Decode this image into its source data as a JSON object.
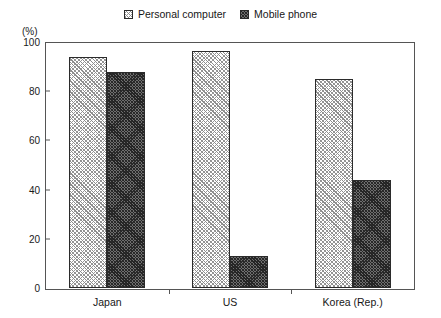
{
  "chart_data": {
    "type": "bar",
    "title": "",
    "subtitle": "",
    "xlabel": "",
    "ylabel": "(%)",
    "ylim": [
      0,
      100
    ],
    "yticks": [
      0,
      20,
      40,
      60,
      80,
      100
    ],
    "ytick_labels": [
      "0",
      "20",
      "40",
      "60",
      "80",
      "100"
    ],
    "grid": false,
    "legend_position": "top-center",
    "categories": [
      "Japan",
      "US",
      "Korea (Rep.)"
    ],
    "series": [
      {
        "name": "Personal computer",
        "swatch": "light-diagonal-hatch",
        "color": "#e8e8e8",
        "values": [
          94,
          96.5,
          85
        ]
      },
      {
        "name": "Mobile phone",
        "swatch": "dark-cross-hatch",
        "color": "#4a4a4a",
        "values": [
          88,
          13,
          44
        ]
      }
    ]
  },
  "legend": {
    "entries": [
      {
        "label": "Personal computer"
      },
      {
        "label": "Mobile phone"
      }
    ]
  },
  "axes": {
    "y_unit_label": "(%)"
  }
}
